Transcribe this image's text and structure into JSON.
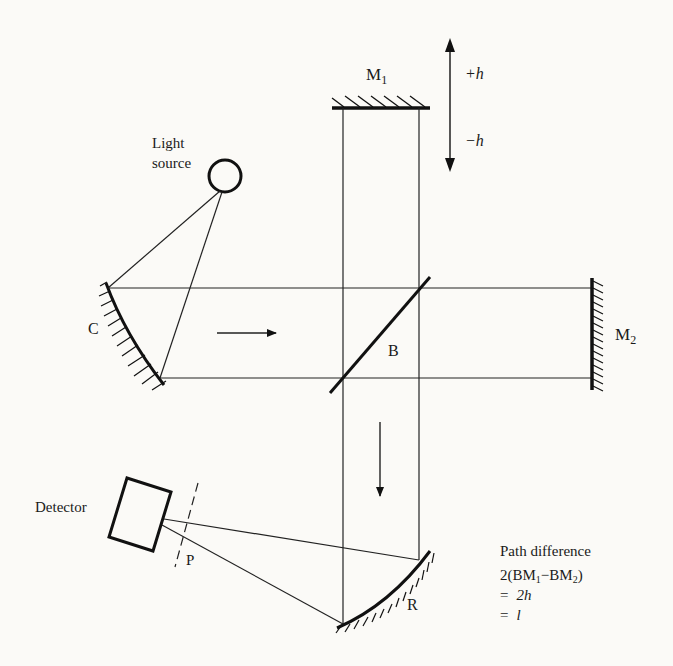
{
  "diagram": {
    "colors": {
      "ink": "#1a1a1a",
      "background": "#fbfaf7"
    },
    "components": {
      "light_source": {
        "label_line1": "Light",
        "label_line2": "source"
      },
      "collimating_mirror": {
        "label": "C"
      },
      "beam_splitter": {
        "label": "B"
      },
      "fixed_mirror": {
        "label": "M",
        "subscript": "2"
      },
      "moving_mirror": {
        "label": "M",
        "subscript": "1"
      },
      "focusing_mirror": {
        "label": "R"
      },
      "detector": {
        "label": "Detector"
      },
      "focal_plane": {
        "label": "P"
      }
    },
    "motion": {
      "plus": "+h",
      "minus": "−h"
    },
    "annotation": {
      "line1": "Path difference",
      "line2_prefix": "2(BM",
      "line2_sub1": "1",
      "line2_mid": "−BM",
      "line2_sub2": "2",
      "line2_suffix": ")",
      "line3_eq": "=",
      "line3_val": "2h",
      "line4_eq": "=",
      "line4_val": "l"
    }
  }
}
